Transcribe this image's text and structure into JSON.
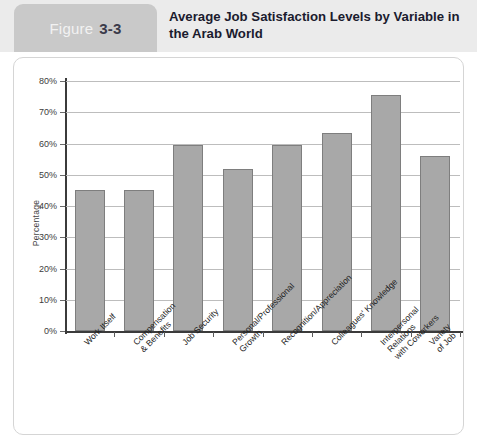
{
  "header": {
    "figure_word": "Figure",
    "figure_number": "3-3",
    "title": "Average Job Satisfaction Levels by Variable in the Arab World",
    "tab_color": "#c9c9c9",
    "band_color": "#ebebeb",
    "title_color": "#1b1b2e"
  },
  "chart_data": {
    "type": "bar",
    "title": "Average Job Satisfaction Levels by Variable in the Arab World",
    "xlabel": "",
    "ylabel": "Percentage",
    "ylim": [
      0,
      80
    ],
    "grid": true,
    "legend": null,
    "bar_color": "#a8a8a8",
    "bar_border_color": "#7e7e7e",
    "ytick_labels": [
      "0%",
      "10%",
      "20%",
      "30%",
      "40%",
      "50%",
      "60%",
      "70%",
      "80%"
    ],
    "ytick_values": [
      0,
      10,
      20,
      30,
      40,
      50,
      60,
      70,
      80
    ],
    "categories": [
      "Work Itself",
      "Compensation\n& Benefits",
      "Job Security",
      "Personal/Professional\nGrowth",
      "Recognition/Appreciation",
      "Colleagues' Knowledge",
      "Interpersonal Relations\nwith Coworkers",
      "Variety of Job"
    ],
    "values": [
      45,
      45,
      59.5,
      52,
      59.5,
      63.5,
      75.5,
      56
    ]
  }
}
